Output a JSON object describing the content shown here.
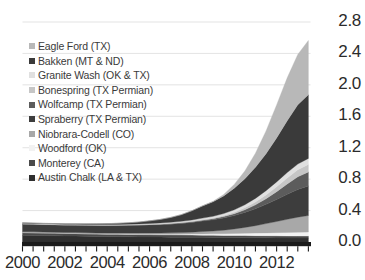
{
  "chart_data": {
    "type": "area",
    "stacked": true,
    "title": "",
    "subtitle": "",
    "xlabel": "",
    "ylabel": "",
    "xlim": [
      2000,
      2013.6
    ],
    "ylim": [
      0.0,
      2.8
    ],
    "y_ticks": [
      "0.0",
      "0.4",
      "0.8",
      "1.2",
      "1.6",
      "2.0",
      "2.4",
      "2.8"
    ],
    "y_tick_values": [
      0.0,
      0.4,
      0.8,
      1.2,
      1.6,
      2.0,
      2.4,
      2.8
    ],
    "x_ticks": [
      "2000",
      "2002",
      "2004",
      "2006",
      "2008",
      "2010",
      "2012"
    ],
    "x_tick_values": [
      2000,
      2002,
      2004,
      2006,
      2008,
      2010,
      2012
    ],
    "grid": true,
    "grid_axis": "y",
    "legend_position": "upper-left-inside",
    "y_axis_side": "right",
    "x": [
      2000,
      2000.5,
      2001,
      2001.5,
      2002,
      2002.5,
      2003,
      2003.5,
      2004,
      2004.5,
      2005,
      2005.5,
      2006,
      2006.5,
      2007,
      2007.5,
      2008,
      2008.5,
      2009,
      2009.5,
      2010,
      2010.5,
      2011,
      2011.5,
      2012,
      2012.5,
      2013,
      2013.5
    ],
    "series": [
      {
        "name": "Austin Chalk (LA & TX)",
        "color": "#2f2f2f",
        "values": [
          0.085,
          0.083,
          0.081,
          0.079,
          0.077,
          0.075,
          0.073,
          0.071,
          0.069,
          0.068,
          0.066,
          0.065,
          0.064,
          0.063,
          0.062,
          0.061,
          0.06,
          0.059,
          0.058,
          0.057,
          0.056,
          0.055,
          0.054,
          0.053,
          0.052,
          0.051,
          0.05,
          0.05
        ]
      },
      {
        "name": "Monterey (CA)",
        "color": "#4a4a4a",
        "values": [
          0.035,
          0.035,
          0.034,
          0.034,
          0.033,
          0.033,
          0.032,
          0.032,
          0.031,
          0.031,
          0.03,
          0.03,
          0.03,
          0.029,
          0.029,
          0.029,
          0.028,
          0.028,
          0.028,
          0.027,
          0.027,
          0.027,
          0.026,
          0.026,
          0.026,
          0.025,
          0.025,
          0.025
        ]
      },
      {
        "name": "Woodford (OK)",
        "color": "#f2f2f2",
        "values": [
          0.0,
          0.0,
          0.0,
          0.0,
          0.0,
          0.0,
          0.0,
          0.0,
          0.0,
          0.001,
          0.002,
          0.003,
          0.004,
          0.006,
          0.008,
          0.01,
          0.013,
          0.016,
          0.018,
          0.021,
          0.025,
          0.029,
          0.033,
          0.037,
          0.041,
          0.045,
          0.049,
          0.052
        ]
      },
      {
        "name": "Niobrara-Codell (CO)",
        "color": "#a8a8a8",
        "values": [
          0.012,
          0.012,
          0.012,
          0.012,
          0.012,
          0.013,
          0.013,
          0.013,
          0.014,
          0.014,
          0.015,
          0.015,
          0.016,
          0.017,
          0.018,
          0.02,
          0.024,
          0.03,
          0.036,
          0.045,
          0.058,
          0.075,
          0.095,
          0.118,
          0.142,
          0.168,
          0.192,
          0.21
        ]
      },
      {
        "name": "Spraberry (TX Permian)",
        "color": "#3d3d3d",
        "values": [
          0.095,
          0.094,
          0.093,
          0.092,
          0.092,
          0.092,
          0.092,
          0.093,
          0.094,
          0.095,
          0.097,
          0.099,
          0.102,
          0.105,
          0.11,
          0.116,
          0.124,
          0.133,
          0.142,
          0.155,
          0.17,
          0.19,
          0.215,
          0.245,
          0.28,
          0.318,
          0.352,
          0.375
        ]
      },
      {
        "name": "Wolfcamp (TX Permian)",
        "color": "#5c5c5c",
        "values": [
          0.004,
          0.004,
          0.004,
          0.004,
          0.004,
          0.004,
          0.005,
          0.005,
          0.005,
          0.005,
          0.006,
          0.006,
          0.007,
          0.007,
          0.008,
          0.009,
          0.01,
          0.012,
          0.014,
          0.018,
          0.024,
          0.034,
          0.05,
          0.072,
          0.1,
          0.132,
          0.162,
          0.18
        ]
      },
      {
        "name": "Bonespring (TX Permian)",
        "color": "#c6c6c6",
        "values": [
          0.002,
          0.002,
          0.002,
          0.002,
          0.002,
          0.002,
          0.002,
          0.003,
          0.003,
          0.003,
          0.003,
          0.004,
          0.004,
          0.005,
          0.005,
          0.006,
          0.007,
          0.009,
          0.011,
          0.014,
          0.019,
          0.026,
          0.036,
          0.048,
          0.062,
          0.076,
          0.088,
          0.095
        ]
      },
      {
        "name": "Granite Wash (OK & TX)",
        "color": "#e0e0e0",
        "values": [
          0.006,
          0.006,
          0.006,
          0.006,
          0.006,
          0.006,
          0.006,
          0.007,
          0.007,
          0.007,
          0.008,
          0.008,
          0.009,
          0.01,
          0.011,
          0.012,
          0.014,
          0.017,
          0.02,
          0.025,
          0.031,
          0.038,
          0.046,
          0.054,
          0.062,
          0.069,
          0.074,
          0.077
        ]
      },
      {
        "name": "Bakken (MT & ND)",
        "color": "#3a3a3a",
        "values": [
          0.005,
          0.005,
          0.005,
          0.006,
          0.006,
          0.007,
          0.008,
          0.009,
          0.011,
          0.014,
          0.018,
          0.024,
          0.033,
          0.045,
          0.062,
          0.085,
          0.118,
          0.155,
          0.185,
          0.225,
          0.275,
          0.33,
          0.395,
          0.47,
          0.56,
          0.66,
          0.755,
          0.81
        ]
      },
      {
        "name": "Eagle Ford (TX)",
        "color": "#b8b8b8",
        "values": [
          0.0,
          0.0,
          0.0,
          0.0,
          0.0,
          0.0,
          0.0,
          0.0,
          0.0,
          0.0,
          0.0,
          0.0,
          0.0,
          0.0,
          0.0,
          0.0,
          0.0,
          0.002,
          0.006,
          0.018,
          0.048,
          0.1,
          0.18,
          0.29,
          0.42,
          0.545,
          0.64,
          0.69
        ]
      }
    ]
  },
  "legend": {
    "items": [
      {
        "label": "Eagle Ford (TX)",
        "color": "#b8b8b8"
      },
      {
        "label": "Bakken (MT & ND)",
        "color": "#3a3a3a"
      },
      {
        "label": "Granite Wash (OK & TX)",
        "color": "#e0e0e0"
      },
      {
        "label": "Bonespring (TX Permian)",
        "color": "#c6c6c6"
      },
      {
        "label": "Wolfcamp (TX Permian)",
        "color": "#5c5c5c"
      },
      {
        "label": "Spraberry (TX Permian)",
        "color": "#3d3d3d"
      },
      {
        "label": "Niobrara-Codell (CO)",
        "color": "#a8a8a8"
      },
      {
        "label": "Woodford (OK)",
        "color": "#f2f2f2"
      },
      {
        "label": "Monterey (CA)",
        "color": "#4a4a4a"
      },
      {
        "label": "Austin Chalk (LA & TX)",
        "color": "#2f2f2f"
      }
    ]
  },
  "axes": {
    "y_ticks": [
      "2.8",
      "2.4",
      "2.0",
      "1.6",
      "1.2",
      "0.8",
      "0.4",
      "0.0"
    ],
    "x_ticks": [
      "2000",
      "2002",
      "2004",
      "2006",
      "2008",
      "2010",
      "2012"
    ]
  },
  "style": {
    "grid_color": "#dcdcdc",
    "axis_color": "#1a1a1a",
    "tick_text_color": "#2b2b2b",
    "legend_text_color": "#3a3a3a",
    "background": "#ffffff"
  }
}
